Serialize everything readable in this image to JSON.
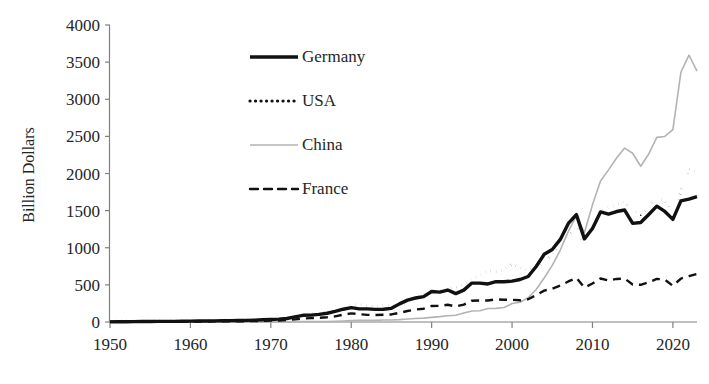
{
  "chart_data": {
    "type": "line",
    "title": "",
    "xlabel": "",
    "ylabel": "Billion Dollars",
    "xlim": [
      1950,
      2023
    ],
    "ylim": [
      0,
      4000
    ],
    "ytick_values": [
      0,
      500,
      1000,
      1500,
      2000,
      2500,
      3000,
      3500,
      4000
    ],
    "ytick_labels": [
      "0",
      "500",
      "1000",
      "1500",
      "2000",
      "2500",
      "3000",
      "3500",
      "4000"
    ],
    "xtick_values": [
      1950,
      1960,
      1970,
      1980,
      1990,
      2000,
      2010,
      2020
    ],
    "xtick_labels": [
      "1950",
      "1960",
      "1970",
      "1980",
      "1990",
      "2000",
      "2010",
      "2020"
    ],
    "grid": false,
    "legend_position": "upper-center-left",
    "x": [
      1950,
      1951,
      1952,
      1953,
      1954,
      1955,
      1956,
      1957,
      1958,
      1959,
      1960,
      1961,
      1962,
      1963,
      1964,
      1965,
      1966,
      1967,
      1968,
      1969,
      1970,
      1971,
      1972,
      1973,
      1974,
      1975,
      1976,
      1977,
      1978,
      1979,
      1980,
      1981,
      1982,
      1983,
      1984,
      1985,
      1986,
      1987,
      1988,
      1989,
      1990,
      1991,
      1992,
      1993,
      1994,
      1995,
      1996,
      1997,
      1998,
      1999,
      2000,
      2001,
      2002,
      2003,
      2004,
      2005,
      2006,
      2007,
      2008,
      2009,
      2010,
      2011,
      2012,
      2013,
      2014,
      2015,
      2016,
      2017,
      2018,
      2019,
      2020,
      2021,
      2022,
      2023
    ],
    "series": [
      {
        "name": "Germany",
        "style": "solid-thick",
        "color": "#111111",
        "values": [
          2,
          3,
          4,
          5,
          6,
          7,
          8,
          9,
          9,
          10,
          12,
          13,
          14,
          15,
          17,
          18,
          20,
          22,
          25,
          30,
          34,
          39,
          47,
          68,
          90,
          92,
          102,
          118,
          143,
          172,
          193,
          177,
          177,
          170,
          172,
          184,
          244,
          295,
          323,
          342,
          410,
          403,
          430,
          382,
          429,
          524,
          524,
          512,
          543,
          542,
          550,
          572,
          613,
          748,
          912,
          977,
          1112,
          1328,
          1446,
          1120,
          1259,
          1482,
          1453,
          1488,
          1508,
          1329,
          1340,
          1448,
          1560,
          1489,
          1382,
          1632,
          1656,
          1688
        ]
      },
      {
        "name": "USA",
        "style": "dotted",
        "color": "#111111",
        "values": [
          10,
          15,
          15,
          16,
          15,
          16,
          19,
          21,
          18,
          17,
          20,
          21,
          21,
          23,
          26,
          27,
          30,
          31,
          34,
          38,
          43,
          44,
          49,
          71,
          99,
          108,
          115,
          121,
          144,
          182,
          225,
          238,
          216,
          202,
          224,
          219,
          227,
          254,
          322,
          363,
          393,
          422,
          448,
          465,
          512,
          584,
          625,
          689,
          682,
          696,
          782,
          729,
          693,
          725,
          819,
          907,
          1026,
          1148,
          1287,
          1056,
          1278,
          1482,
          1545,
          1578,
          1621,
          1503,
          1451,
          1546,
          1664,
          1644,
          1430,
          1754,
          2065,
          2019
        ]
      },
      {
        "name": "China",
        "style": "solid-thin",
        "color": "#b3b3b3",
        "values": [
          0.6,
          0.8,
          0.9,
          1.0,
          1.1,
          1.4,
          1.6,
          1.6,
          1.9,
          2.2,
          1.9,
          1.5,
          1.5,
          1.6,
          1.8,
          2.0,
          2.2,
          1.9,
          1.9,
          2.2,
          2.3,
          2.6,
          3.4,
          5.8,
          7.0,
          7.3,
          6.9,
          7.6,
          9.8,
          13.7,
          18.1,
          22.0,
          22.3,
          22.2,
          26.1,
          27.3,
          31.4,
          39.4,
          47.5,
          52.5,
          62.9,
          71.9,
          85.0,
          91.7,
          121.0,
          148.8,
          151.1,
          182.8,
          183.7,
          194.9,
          249.2,
          266.1,
          325.6,
          438.2,
          593.3,
          762.0,
          969.0,
          1220,
          1430,
          1202,
          1578,
          1898,
          2049,
          2209,
          2342,
          2273,
          2098,
          2263,
          2487,
          2499,
          2590,
          3364,
          3594,
          3380
        ]
      },
      {
        "name": "France",
        "style": "dashed",
        "color": "#111111",
        "values": [
          3,
          4,
          4,
          4,
          4,
          5,
          5,
          5,
          5,
          6,
          6,
          7,
          7,
          8,
          8,
          10,
          10,
          11,
          12,
          15,
          18,
          20,
          26,
          36,
          46,
          52,
          57,
          64,
          76,
          98,
          116,
          106,
          96,
          94,
          97,
          102,
          124,
          148,
          168,
          179,
          216,
          217,
          232,
          210,
          235,
          287,
          289,
          290,
          305,
          300,
          298,
          292,
          307,
          363,
          422,
          449,
          490,
          546,
          594,
          464,
          518,
          586,
          558,
          580,
          586,
          506,
          501,
          535,
          581,
          570,
          488,
          585,
          617,
          648
        ]
      }
    ]
  },
  "legend": [
    {
      "label": "Germany",
      "swatch": "solid-thick-line-swatch"
    },
    {
      "label": "USA",
      "swatch": "dotted-line-swatch"
    },
    {
      "label": "China",
      "swatch": "thin-gray-line-swatch"
    },
    {
      "label": "France",
      "swatch": "dashed-line-swatch"
    }
  ]
}
